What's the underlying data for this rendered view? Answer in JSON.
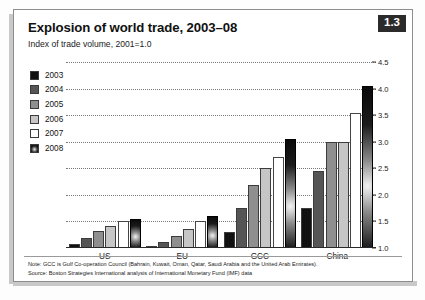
{
  "badge": {
    "label": "1.3"
  },
  "header": {
    "title": "Explosion of world trade, 2003–08",
    "subtitle": "Index of trade volume, 2001=1.0"
  },
  "footnote": {
    "note": "Note: GCC is Gulf Co-operation Council (Bahrain, Kuwait, Oman, Qatar, Saudi Arabia and the United Arab Emirates).",
    "source": "Source: Boston Strategies International analysis of International Monetary Fund (IMF) data"
  },
  "legend": {
    "items": [
      {
        "label": "2003",
        "color": "#111111"
      },
      {
        "label": "2004",
        "color": "#555555"
      },
      {
        "label": "2005",
        "color": "#8f8f8f"
      },
      {
        "label": "2006",
        "color": "#c6c6c6"
      },
      {
        "label": "2007",
        "color": "#ffffff"
      },
      {
        "label": "2008",
        "color": "gradient"
      }
    ]
  },
  "chart_data": {
    "type": "bar",
    "title": "Explosion of world trade, 2003–08",
    "subtitle": "Index of trade volume, 2001=1.0",
    "xlabel": "",
    "ylabel": "",
    "ylim": [
      1.0,
      4.5
    ],
    "yticks": [
      "1.0",
      "1.5",
      "2.0",
      "2.5",
      "3.0",
      "3.5",
      "4.0",
      "4.5"
    ],
    "ytick_values": [
      1.0,
      1.5,
      2.0,
      2.5,
      3.0,
      3.5,
      4.0,
      4.5
    ],
    "grid": true,
    "legend_position": "upper-left",
    "categories": [
      "US",
      "EU",
      "GCC",
      "China"
    ],
    "series": [
      {
        "name": "2003",
        "color": "#111111",
        "values": [
          1.08,
          1.02,
          1.3,
          1.75
        ]
      },
      {
        "name": "2004",
        "color": "#555555",
        "values": [
          1.18,
          1.12,
          1.75,
          2.45
        ]
      },
      {
        "name": "2005",
        "color": "#8f8f8f",
        "values": [
          1.32,
          1.22,
          2.18,
          3.0
        ]
      },
      {
        "name": "2006",
        "color": "#c6c6c6",
        "values": [
          1.42,
          1.35,
          2.5,
          3.0
        ]
      },
      {
        "name": "2007",
        "color": "#ffffff",
        "values": [
          1.5,
          1.5,
          2.72,
          3.55
        ]
      },
      {
        "name": "2008",
        "color": "gradient",
        "values": [
          1.55,
          1.6,
          3.05,
          4.05
        ]
      }
    ]
  }
}
